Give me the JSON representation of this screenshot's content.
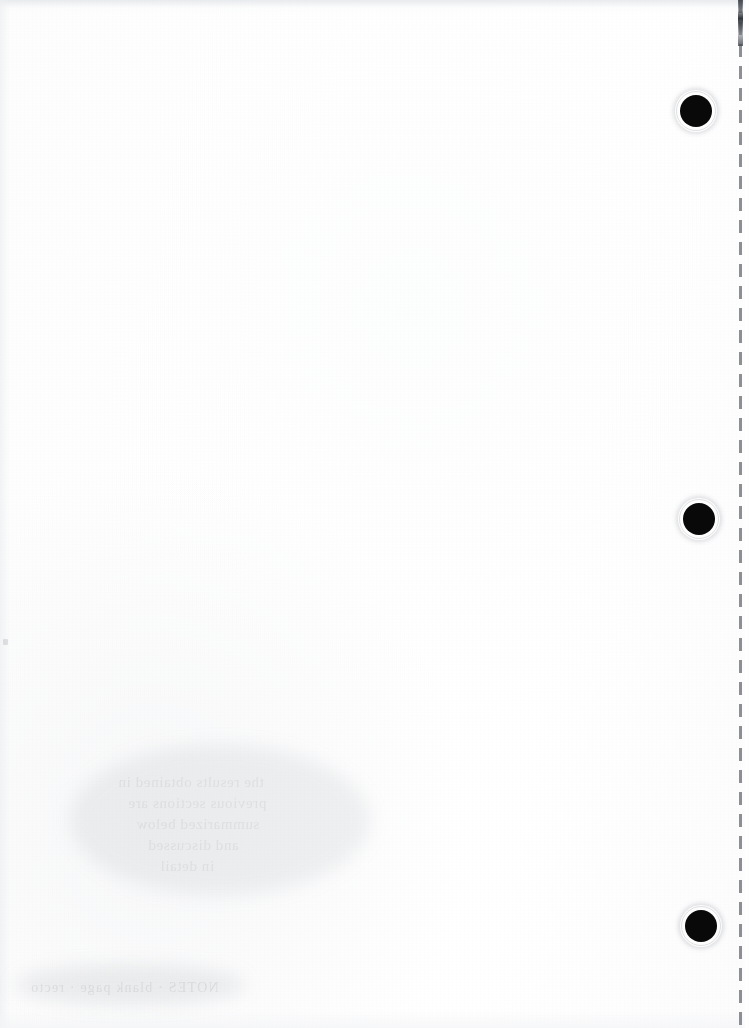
{
  "document": {
    "title": "Scanned Blank Page",
    "page_kind": "blank-scanned-sheet",
    "width_px": 749,
    "height_px": 1028,
    "background_color": "#ffffff",
    "paper_tone": "#fdfdfd",
    "body_text": ""
  },
  "binding": {
    "label": "right-margin-binding",
    "perforation": {
      "label": "perforation-dashed-line",
      "x_px": 740,
      "color": "#787c82",
      "dash_length_px": 13,
      "gap_length_px": 9,
      "top_mark": {
        "label": "perforation-top-mark",
        "x_px": 739,
        "y_px": 0,
        "height_px": 46,
        "color": "#42464c"
      }
    },
    "holes": [
      {
        "label": "punch-hole-top",
        "cx_px": 696,
        "cy_px": 111,
        "radius_px": 16,
        "color": "#090909"
      },
      {
        "label": "punch-hole-middle",
        "cx_px": 699,
        "cy_px": 519,
        "radius_px": 16,
        "color": "#090909"
      },
      {
        "label": "punch-hole-bottom",
        "cx_px": 701,
        "cy_px": 926,
        "radius_px": 16,
        "color": "#090909"
      }
    ]
  },
  "artifacts": {
    "label": "scan-artifacts",
    "show_through": [
      {
        "label": "ghost-line-1",
        "x_px": 118,
        "y_px": 772,
        "text": "the results obtained in"
      },
      {
        "label": "ghost-line-2",
        "x_px": 128,
        "y_px": 793,
        "text": "previous sections are"
      },
      {
        "label": "ghost-line-3",
        "x_px": 136,
        "y_px": 814,
        "text": "summarized below"
      },
      {
        "label": "ghost-line-4",
        "x_px": 148,
        "y_px": 835,
        "text": "and discussed"
      },
      {
        "label": "ghost-line-5",
        "x_px": 160,
        "y_px": 856,
        "text": "in detail"
      }
    ],
    "footer_ghost": {
      "label": "ghost-footer-text",
      "x_px": 30,
      "y_px": 980,
      "text": "NOTES  ·  blank page  ·  recto"
    },
    "edge_speck": {
      "label": "edge-speck",
      "x_px": 3,
      "y_px": 639,
      "width_px": 5,
      "height_px": 6
    }
  }
}
